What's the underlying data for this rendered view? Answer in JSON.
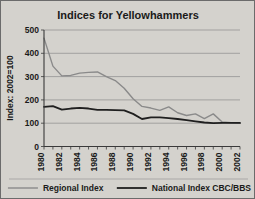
{
  "chart_data": {
    "type": "line",
    "title": "Indices for Yellowhammers",
    "xlabel": "",
    "ylabel": "Index: 2002=100",
    "x": [
      1980,
      1981,
      1982,
      1983,
      1984,
      1985,
      1986,
      1987,
      1988,
      1989,
      1990,
      1991,
      1992,
      1993,
      1994,
      1995,
      1996,
      1997,
      1998,
      1999,
      2000,
      2001,
      2002
    ],
    "xtick_labels": [
      "1980",
      "1982",
      "1984",
      "1986",
      "1988",
      "1990",
      "1992",
      "1994",
      "1996",
      "1998",
      "2000",
      "2002"
    ],
    "xtick_values": [
      1980,
      1982,
      1984,
      1986,
      1988,
      1990,
      1992,
      1994,
      1996,
      1998,
      2000,
      2002
    ],
    "ytick_labels": [
      "0",
      "100",
      "200",
      "300",
      "400",
      "500"
    ],
    "ytick_values": [
      0,
      100,
      200,
      300,
      400,
      500
    ],
    "ylim": [
      0,
      500
    ],
    "xlim": [
      1980,
      2002
    ],
    "grid": true,
    "legend_position": "bottom",
    "series": [
      {
        "name": "Regional Index",
        "color": "#8a8a8a",
        "width": 1.4,
        "values": [
          465,
          345,
          303,
          305,
          315,
          318,
          320,
          300,
          283,
          250,
          205,
          172,
          165,
          155,
          170,
          145,
          133,
          140,
          120,
          140,
          105,
          102,
          100
        ]
      },
      {
        "name": "National Index CBC/BBS",
        "color": "#1f1f1f",
        "width": 1.8,
        "values": [
          170,
          173,
          158,
          163,
          166,
          163,
          157,
          157,
          156,
          155,
          140,
          118,
          125,
          125,
          122,
          118,
          113,
          108,
          103,
          100,
          101,
          101,
          101
        ]
      }
    ]
  },
  "legend": {
    "items": [
      {
        "label": "Regional Index",
        "color": "#8a8a8a"
      },
      {
        "label": "National Index CBC/BBS",
        "color": "#1f1f1f"
      }
    ]
  },
  "colors": {
    "background": "#d4d2cd",
    "frame": "#6b6b6b",
    "grid": "#8d8d8d",
    "axis": "#3a3a3a",
    "text": "#1a1a1a"
  }
}
